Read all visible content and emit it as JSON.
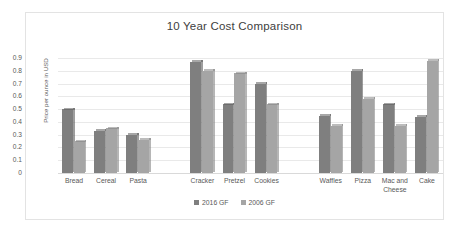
{
  "chart_data": {
    "type": "bar",
    "title": "10 Year Cost Comparison",
    "xlabel": "",
    "ylabel": "Price per ounce in USD",
    "ylim": [
      0,
      0.9
    ],
    "ytick_labels": [
      "0.9",
      "0.8",
      "0.7",
      "0.6",
      "0.5",
      "0.4",
      "0.3",
      "0.2",
      "0.1",
      "0"
    ],
    "ytick_values": [
      0.9,
      0.8,
      0.7,
      0.6,
      0.5,
      0.4,
      0.3,
      0.2,
      0.1,
      0
    ],
    "grid": true,
    "legend_position": "bottom",
    "categories": [
      "Bread",
      "Cereal",
      "Pasta",
      "",
      "Cracker",
      "Pretzel",
      "Cookies",
      "",
      "Waffles",
      "Pizza",
      "Mac and Cheese",
      "Cake"
    ],
    "series": [
      {
        "name": "2016 GF",
        "color": "#7f7f7f",
        "values": [
          0.5,
          0.33,
          0.3,
          null,
          0.87,
          0.54,
          0.7,
          null,
          0.45,
          0.8,
          0.54,
          0.44
        ]
      },
      {
        "name": "2006 GF",
        "color": "#a5a5a5",
        "values": [
          0.25,
          0.35,
          0.26,
          null,
          0.8,
          0.78,
          0.54,
          null,
          0.37,
          0.58,
          0.37,
          0.88
        ]
      }
    ]
  }
}
